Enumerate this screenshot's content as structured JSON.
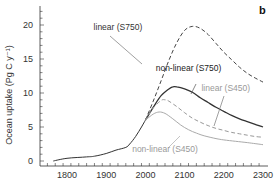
{
  "chart_data": {
    "type": "line",
    "panel_label": "b",
    "title": "",
    "xlabel": "",
    "ylabel": "Ocean uptake (Pg C y⁻¹)",
    "xlim": [
      1750,
      2300
    ],
    "ylim": [
      0,
      22
    ],
    "x_ticks": [
      1800,
      1900,
      2000,
      2100,
      2200,
      2300
    ],
    "y_ticks": [
      0,
      5,
      10,
      15,
      20
    ],
    "grid": false,
    "legend": "inline annotations",
    "series": [
      {
        "name": "historical",
        "style": "solid",
        "color": "#333333",
        "x": [
          1765,
          1800,
          1850,
          1870,
          1900,
          1925,
          1950,
          1960,
          1975,
          1990,
          2000
        ],
        "y": [
          0.0,
          0.4,
          0.6,
          0.7,
          1.1,
          1.6,
          2.0,
          2.5,
          3.6,
          5.0,
          6.0
        ]
      },
      {
        "name": "linear (S750)",
        "style": "dashed",
        "color": "#444444",
        "x": [
          2000,
          2020,
          2040,
          2060,
          2080,
          2100,
          2120,
          2140,
          2160,
          2180,
          2200,
          2220,
          2240,
          2260,
          2280,
          2300
        ],
        "y": [
          6.0,
          8.8,
          11.8,
          14.8,
          17.4,
          19.2,
          19.8,
          19.5,
          18.6,
          17.3,
          16.0,
          14.9,
          13.8,
          12.9,
          12.2,
          11.6
        ]
      },
      {
        "name": "non-linear (S750)",
        "style": "solid",
        "color": "#333333",
        "x": [
          2000,
          2020,
          2040,
          2060,
          2070,
          2080,
          2100,
          2120,
          2140,
          2160,
          2180,
          2200,
          2220,
          2240,
          2260,
          2280,
          2300
        ],
        "y": [
          6.0,
          7.9,
          9.6,
          10.6,
          10.9,
          10.9,
          10.6,
          10.1,
          9.3,
          8.6,
          7.9,
          7.3,
          6.7,
          6.2,
          5.8,
          5.4,
          5.0
        ]
      },
      {
        "name": "linear (S450)",
        "style": "dashed",
        "color": "#999999",
        "x": [
          2000,
          2020,
          2040,
          2050,
          2060,
          2080,
          2100,
          2120,
          2140,
          2160,
          2180,
          2200,
          2220,
          2240,
          2260,
          2280,
          2300
        ],
        "y": [
          6.0,
          7.8,
          8.9,
          9.0,
          8.8,
          8.0,
          7.1,
          6.3,
          5.7,
          5.2,
          4.8,
          4.5,
          4.2,
          4.0,
          3.8,
          3.6,
          3.5
        ]
      },
      {
        "name": "non-linear (S450)",
        "style": "solid",
        "color": "#aaaaaa",
        "x": [
          2000,
          2020,
          2035,
          2050,
          2070,
          2090,
          2110,
          2130,
          2150,
          2180,
          2200,
          2230,
          2260,
          2300
        ],
        "y": [
          6.0,
          6.9,
          7.2,
          7.0,
          6.2,
          5.3,
          4.6,
          4.1,
          3.7,
          3.3,
          3.1,
          2.9,
          2.7,
          2.4
        ]
      }
    ],
    "annotations": [
      {
        "text": "linear (S750)",
        "x": 1930,
        "y": 19.3,
        "color": "#333333"
      },
      {
        "text": "non-linear (S750)",
        "x": 2110,
        "y": 13.2,
        "color": "#222222"
      },
      {
        "text": "linear (S450)",
        "x": 2205,
        "y": 10.3,
        "color": "#999999"
      },
      {
        "text": "non-linear (S450)",
        "x": 2050,
        "y": 1.3,
        "color": "#999999"
      }
    ]
  }
}
